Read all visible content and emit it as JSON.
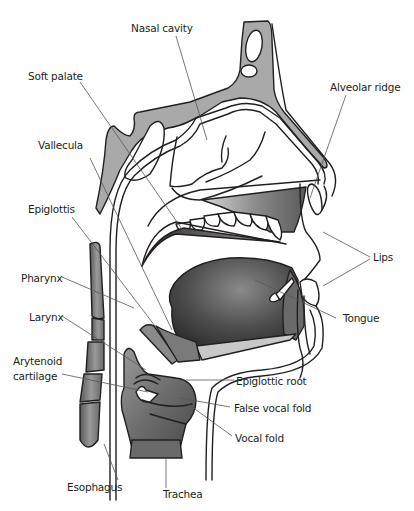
{
  "diagram": {
    "type": "anatomical-cross-section",
    "colors": {
      "outline": "#231f20",
      "bone_fill": "#a9a9a9",
      "tissue_dark": "#4a4a4a",
      "tissue_mid": "#7a7a7a",
      "leader_line": "#555555",
      "background": "#ffffff"
    },
    "labels": {
      "nasal_cavity": "Nasal cavity",
      "soft_palate": "Soft palate",
      "alveolar_ridge": "Alveolar ridge",
      "vallecula": "Vallecula",
      "epiglottis": "Epiglottis",
      "lips": "Lips",
      "pharynx": "Pharynx",
      "larynx": "Larynx",
      "tongue": "Tongue",
      "arytenoid_line1": "Arytenoid",
      "arytenoid_line2": "cartilage",
      "epiglottic_root": "Epiglottic root",
      "false_vocal_fold": "False vocal fold",
      "vocal_fold": "Vocal fold",
      "esophagus": "Esophagus",
      "trachea": "Trachea"
    }
  }
}
